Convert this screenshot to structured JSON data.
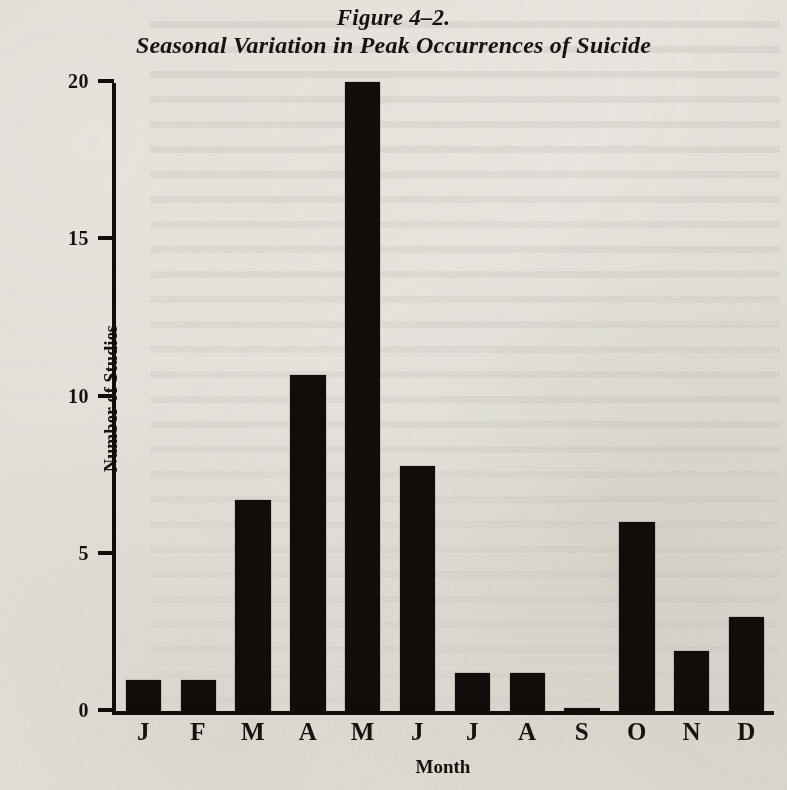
{
  "figure": {
    "number": "Figure 4–2.",
    "caption": "Seasonal Variation in Peak Occurrences of Suicide"
  },
  "chart_data": {
    "type": "bar",
    "title": "Seasonal Variation in Peak Occurrences of Suicide",
    "subtitle": "Figure 4–2.",
    "xlabel": "Month",
    "ylabel": "Number of Studies",
    "categories": [
      "J",
      "F",
      "M",
      "A",
      "M",
      "J",
      "J",
      "A",
      "S",
      "O",
      "N",
      "D"
    ],
    "category_names": [
      "January",
      "February",
      "March",
      "April",
      "May",
      "June",
      "July",
      "August",
      "September",
      "October",
      "November",
      "December"
    ],
    "values": [
      1,
      1,
      6.7,
      10.7,
      20,
      7.8,
      1.2,
      1.2,
      0.1,
      6,
      1.9,
      3
    ],
    "ylim": [
      0,
      20
    ],
    "yticks": [
      0,
      5,
      10,
      15,
      20
    ],
    "ytick_labels": [
      "0",
      "5",
      "10",
      "15",
      "20"
    ],
    "grid": false,
    "legend": null,
    "bar_color": "#100d0a",
    "background_color": "#e9e7e1"
  }
}
